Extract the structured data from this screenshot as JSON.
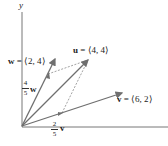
{
  "diagram": {
    "axes": {
      "y_label": "y",
      "x_label": ""
    },
    "colors": {
      "vector": "#6f6f6f",
      "axis": "#777777",
      "dashed": "#8a8a8a",
      "text": "#222222"
    },
    "vectors": [
      {
        "name": "u",
        "components": [
          4,
          4
        ],
        "label_bold": "u",
        "label_rest": " = ⟨4, 4⟩"
      },
      {
        "name": "v",
        "components": [
          6,
          2
        ],
        "label_bold": "v",
        "label_rest": " = ⟨6, 2⟩"
      },
      {
        "name": "w",
        "components": [
          2,
          4
        ],
        "label_bold": "w",
        "label_rest": " = ⟨2, 4⟩"
      }
    ],
    "scaled": [
      {
        "name": "w_scaled",
        "num": "4",
        "den": "5",
        "vec": "w"
      },
      {
        "name": "v_scaled",
        "num": "2",
        "den": "5",
        "vec": "v"
      }
    ]
  }
}
